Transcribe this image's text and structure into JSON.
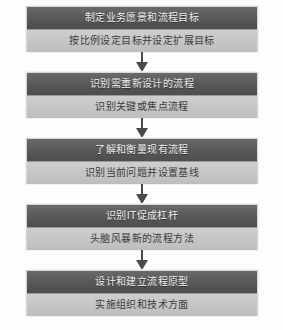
{
  "diagram": {
    "kind": "vertical-flowchart",
    "background_color": "#fdfdfd",
    "header_color": "#575757",
    "body_color": "#c4c4c4",
    "header_text_color": "#efefef",
    "body_text_color": "#3c3c3c",
    "arrow_color": "#4a4a4a",
    "steps": [
      {
        "title": "制定业务愿景和流程目标",
        "subtitle": "按比例设定目标并设定扩展目标"
      },
      {
        "title": "识别需重新设计的流程",
        "subtitle": "识别关键或焦点流程"
      },
      {
        "title": "了解和衡量现有流程",
        "subtitle": "识别当前问题并设置基线"
      },
      {
        "title": "识别IT促成杠杆",
        "subtitle": "头脑风暴新的流程方法"
      },
      {
        "title": "设计和建立流程原型",
        "subtitle": "实施组织和技术方面"
      }
    ],
    "arrows": [
      {
        "label": "arrow-step-1-to-2"
      },
      {
        "label": "arrow-step-2-to-3"
      },
      {
        "label": "arrow-step-3-to-4"
      },
      {
        "label": "arrow-step-4-to-5"
      }
    ]
  }
}
